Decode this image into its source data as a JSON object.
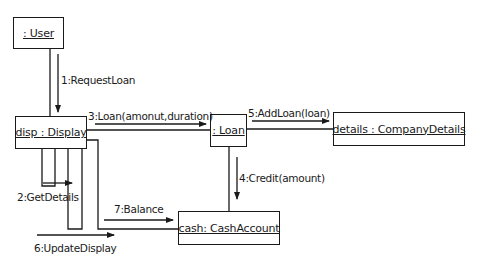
{
  "diagram": {
    "type": "UML collaboration diagram",
    "objects": [
      {
        "id": "user",
        "label": ": User"
      },
      {
        "id": "display",
        "label": "disp : Display"
      },
      {
        "id": "loan",
        "label": ": Loan"
      },
      {
        "id": "company_details",
        "label": "details : CompanyDetails"
      },
      {
        "id": "cash_account",
        "label": "cash: CashAccount"
      }
    ],
    "messages": [
      {
        "seq": 1,
        "label": "1:RequestLoan",
        "from": "user",
        "to": "display"
      },
      {
        "seq": 2,
        "label": "2:GetDetails",
        "from": "display",
        "to": "display"
      },
      {
        "seq": 3,
        "label": "3:Loan(amonut,duration)",
        "from": "display",
        "to": "loan"
      },
      {
        "seq": 4,
        "label": "4:Credit(amount)",
        "from": "loan",
        "to": "cash_account"
      },
      {
        "seq": 5,
        "label": "5:AddLoan(loan)",
        "from": "loan",
        "to": "company_details"
      },
      {
        "seq": 6,
        "label": "6:UpdateDisplay",
        "from": "display",
        "to": "display"
      },
      {
        "seq": 7,
        "label": "7:Balance",
        "from": "display",
        "to": "cash_account"
      }
    ]
  },
  "colors": {
    "line": "#1a1a1a",
    "background": "#ffffff"
  }
}
